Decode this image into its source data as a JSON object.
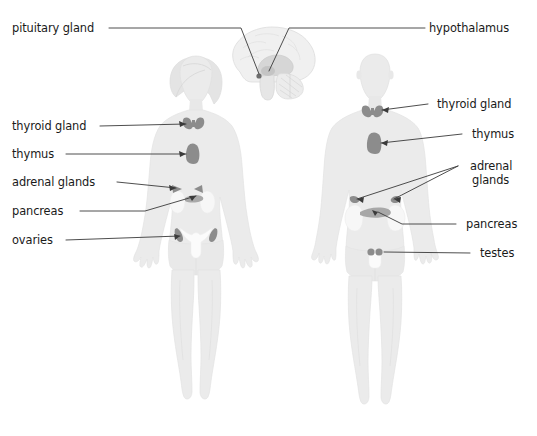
{
  "figure": {
    "background_color": "#ffffff",
    "body_fill": "#ebebeb",
    "body_stroke": "#dcdcdc",
    "organ_fill": "#8c8c8c",
    "organ_fill_light": "#a8a8a8",
    "kidney_fill": "#f7f7f7",
    "uterus_fill": "#fbfbfb",
    "brain_fill": "#f0f0f0",
    "brain_stroke": "#d8d8d8",
    "leader_color": "#3a3a3a",
    "text_color": "#1a1a1a"
  },
  "labels_left": [
    {
      "id": "pituitary-gland",
      "text": "pituitary gland",
      "x": 12,
      "y": 32
    },
    {
      "id": "thyroid-gland",
      "text": "thyroid gland",
      "x": 12,
      "y": 130
    },
    {
      "id": "thymus",
      "text": "thymus",
      "x": 12,
      "y": 158
    },
    {
      "id": "adrenal-glands",
      "text": "adrenal glands",
      "x": 12,
      "y": 186
    },
    {
      "id": "pancreas",
      "text": "pancreas",
      "x": 12,
      "y": 215
    },
    {
      "id": "ovaries",
      "text": "ovaries",
      "x": 12,
      "y": 244
    }
  ],
  "labels_right": [
    {
      "id": "hypothalamus",
      "text": "hypothalamus",
      "x": 429,
      "y": 32
    },
    {
      "id": "thyroid-gland-m",
      "text": "thyroid gland",
      "x": 437,
      "y": 108
    },
    {
      "id": "thymus-m",
      "text": "thymus",
      "x": 472,
      "y": 138
    },
    {
      "id": "adrenal-glands-m1",
      "text": "adrenal",
      "x": 470,
      "y": 170
    },
    {
      "id": "adrenal-glands-m2",
      "text": "glands",
      "x": 472,
      "y": 184
    },
    {
      "id": "pancreas-m",
      "text": "pancreas",
      "x": 466,
      "y": 228
    },
    {
      "id": "testes-m",
      "text": "testes",
      "x": 480,
      "y": 257
    }
  ],
  "figures": [
    {
      "id": "female-figure",
      "label": "female body outline",
      "center_x": 196
    },
    {
      "id": "male-figure",
      "label": "male body outline",
      "center_x": 374
    }
  ],
  "organs": [
    {
      "id": "brain-sagittal",
      "label": "brain sagittal section",
      "side": "center"
    },
    {
      "id": "pituitary-gland-organ",
      "label": "pituitary gland",
      "side": "center"
    },
    {
      "id": "hypothalamus-organ",
      "label": "hypothalamus",
      "side": "center"
    },
    {
      "id": "female-thyroid",
      "label": "thyroid gland",
      "side": "female"
    },
    {
      "id": "female-thymus",
      "label": "thymus",
      "side": "female"
    },
    {
      "id": "female-adrenals",
      "label": "adrenal glands",
      "side": "female"
    },
    {
      "id": "female-kidneys",
      "label": "kidneys",
      "side": "female"
    },
    {
      "id": "female-pancreas",
      "label": "pancreas",
      "side": "female"
    },
    {
      "id": "female-uterus",
      "label": "uterus",
      "side": "female"
    },
    {
      "id": "female-ovaries",
      "label": "ovaries",
      "side": "female"
    },
    {
      "id": "male-thyroid",
      "label": "thyroid gland",
      "side": "male"
    },
    {
      "id": "male-thymus",
      "label": "thymus",
      "side": "male"
    },
    {
      "id": "male-adrenals",
      "label": "adrenal glands",
      "side": "male"
    },
    {
      "id": "male-kidneys",
      "label": "kidneys",
      "side": "male"
    },
    {
      "id": "male-pancreas",
      "label": "pancreas",
      "side": "male"
    },
    {
      "id": "male-testes",
      "label": "testes",
      "side": "male"
    }
  ]
}
